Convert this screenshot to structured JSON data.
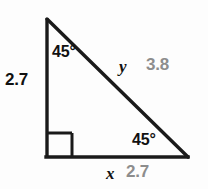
{
  "figure": {
    "type": "right-triangle-diagram",
    "colors": {
      "stroke": "#1a1a1a",
      "known_label": "#111111",
      "answer_label": "#8d8d8d",
      "background": "#fdfdfd"
    },
    "geometry": {
      "apex": [
        47,
        19
      ],
      "right_angle_vertex": [
        47,
        157
      ],
      "base_right_vertex": [
        188,
        157
      ],
      "right_angle_marker_size": 25,
      "stroke_width": 3
    },
    "labels": {
      "angle_top": "45°",
      "angle_bottom_right": "45°",
      "leg_left_length": "2.7",
      "hypotenuse_variable": "y",
      "hypotenuse_length": "3.8",
      "base_variable": "x",
      "base_length": "2.7"
    }
  }
}
